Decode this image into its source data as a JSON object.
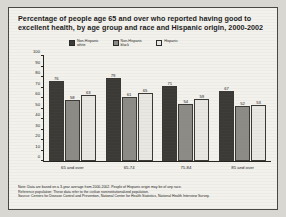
{
  "title": "Percentage of people age 65 and over who reported having good to excellent health, by age group and race and Hispanic origin, 2000-2002",
  "legend": [
    {
      "label": "Non-Hispanic\nwhite",
      "color": "#3c3a36"
    },
    {
      "label": "Non-Hispanic\nblack",
      "color": "#8d8b85"
    },
    {
      "label": "Hispanic",
      "color": "#e8e7e1"
    }
  ],
  "notes": [
    "Note: Data are based on a 3-year average from 2000-2002. People of Hispanic origin may be of any race.",
    "Reference population: These data refer to the civilian noninstitutionalized population.",
    "Source: Centers for Disease Control and Prevention, National Center for Health Statistics, National Health Interview Survey."
  ],
  "chart_data": {
    "type": "bar",
    "title": "Percentage of people age 65 and over who reported having good to excellent health, by age group and race and Hispanic origin, 2000-2002",
    "xlabel": "",
    "ylabel": "",
    "ylim": [
      0,
      100
    ],
    "yticks": [
      0,
      10,
      20,
      30,
      40,
      50,
      60,
      70,
      80,
      90,
      100
    ],
    "grid": false,
    "legend_position": "top",
    "categories": [
      "65 and over",
      "65-74",
      "75-84",
      "85 and over"
    ],
    "series": [
      {
        "name": "Non-Hispanic white",
        "color": "#3c3a36",
        "values": [
          76,
          79,
          71,
          67
        ]
      },
      {
        "name": "Non-Hispanic black",
        "color": "#8d8b85",
        "values": [
          58,
          61,
          54,
          52
        ]
      },
      {
        "name": "Hispanic",
        "color": "#e8e7e1",
        "values": [
          63,
          65,
          59,
          53
        ]
      }
    ]
  }
}
